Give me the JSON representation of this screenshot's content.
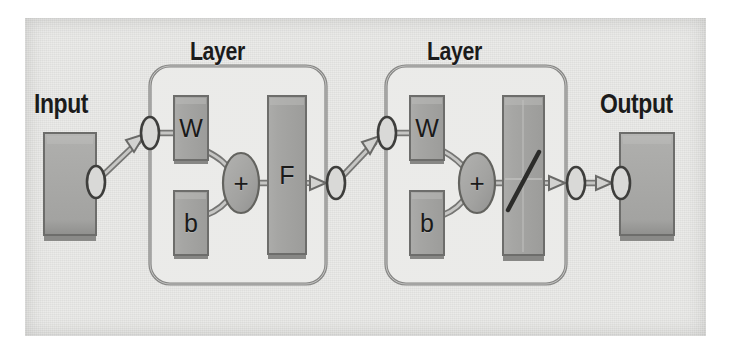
{
  "diagram": {
    "title_labels": {
      "input": "Input",
      "output": "Output",
      "layer_1": "Layer",
      "layer_2": "Layer"
    },
    "blocks": {
      "input_box": "",
      "output_box": "",
      "layer1_weight": "W",
      "layer1_bias": "b",
      "layer1_sum": "+",
      "layer1_transfer": "F",
      "layer2_weight": "W",
      "layer2_bias": "b",
      "layer2_sum": "+",
      "layer2_transfer": ""
    },
    "colors": {
      "page_background": "#ffffff",
      "panel_background": "#e8e8e6",
      "block_fill": "#a8a8a6",
      "block_fill_dark": "#9b9b99",
      "block_stroke": "#6d6d6b",
      "container_stroke": "#8d8d8b",
      "container_fill": "#ececea",
      "connector": "#9a9a98",
      "connector_stroke": "#5f5f5d",
      "text": "#1b1b1b"
    },
    "structure": {
      "flow": "Input -> Layer -> Layer -> Output",
      "layer_internal_flow": "W and b feed the sum node (+), whose output feeds the transfer function block",
      "layer1_transfer_symbol": "F",
      "layer2_transfer_symbol": "linear-slash"
    }
  }
}
